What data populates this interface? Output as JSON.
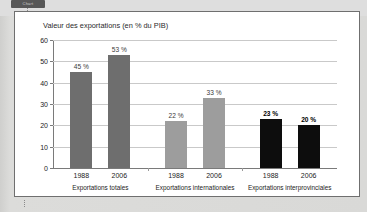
{
  "page": {
    "tab_label": "Chart",
    "panel_background": "#ffffff",
    "panel_border_color": "#6f6f6f"
  },
  "chart_data": {
    "type": "bar",
    "title": "Valeur des exportations (en % du PIB)",
    "xlabel": "",
    "ylabel": "",
    "ylim": [
      0,
      60
    ],
    "yticks": [
      0,
      10,
      20,
      30,
      40,
      50,
      60
    ],
    "ytick_labels": [
      "0",
      "10",
      "20",
      "30",
      "40",
      "50",
      "60"
    ],
    "grid": true,
    "legend": "none",
    "value_suffix": " %",
    "groups": [
      {
        "name": "Exportations totales",
        "color": "#6e6e6e",
        "bold_labels": false,
        "bars": [
          {
            "category": "1988",
            "value": 45,
            "label": "45 %"
          },
          {
            "category": "2006",
            "value": 53,
            "label": "53 %"
          }
        ]
      },
      {
        "name": "Exportations internationales",
        "color": "#9d9d9d",
        "bold_labels": false,
        "bars": [
          {
            "category": "1988",
            "value": 22,
            "label": "22 %"
          },
          {
            "category": "2006",
            "value": 33,
            "label": "33 %"
          }
        ]
      },
      {
        "name": "Exportations interprovinciales",
        "color": "#0d0d0d",
        "bold_labels": true,
        "bars": [
          {
            "category": "1988",
            "value": 23,
            "label": "23 %"
          },
          {
            "category": "2006",
            "value": 20,
            "label": "20 %"
          }
        ]
      }
    ]
  }
}
